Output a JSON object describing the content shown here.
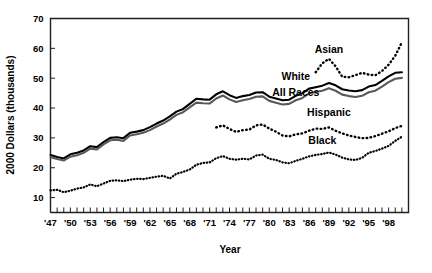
{
  "chart_data": {
    "type": "line",
    "title": "",
    "xlabel": "Year",
    "ylabel": "2000 Dollars (thousands)",
    "xlim": [
      1947,
      2001
    ],
    "ylim": [
      5,
      70
    ],
    "yticks": [
      10,
      20,
      30,
      40,
      50,
      60,
      70
    ],
    "ytick_labels": [
      "10",
      "20",
      "30",
      "40",
      "50",
      "60",
      "70"
    ],
    "xtick_labels": [
      "'47",
      "'50",
      "'53",
      "'56",
      "'59",
      "'62",
      "'65",
      "'68",
      "'71",
      "'74",
      "'77",
      "'80",
      "'83",
      "'86",
      "'89",
      "'92",
      "'95",
      "'98"
    ],
    "xtick_label_years": [
      1947,
      1950,
      1953,
      1956,
      1959,
      1962,
      1965,
      1968,
      1971,
      1974,
      1977,
      1980,
      1983,
      1986,
      1989,
      1992,
      1995,
      1998
    ],
    "minor_tick_years": [
      1947,
      1948,
      1949,
      1950,
      1951,
      1952,
      1953,
      1954,
      1955,
      1956,
      1957,
      1958,
      1959,
      1960,
      1961,
      1962,
      1963,
      1964,
      1965,
      1966,
      1967,
      1968,
      1969,
      1970,
      1971,
      1972,
      1973,
      1974,
      1975,
      1976,
      1977,
      1978,
      1979,
      1980,
      1981,
      1982,
      1983,
      1984,
      1985,
      1986,
      1987,
      1988,
      1989,
      1990,
      1991,
      1992,
      1993,
      1994,
      1995,
      1996,
      1997,
      1998,
      1999,
      2000,
      2001
    ],
    "grid": false,
    "legend_position": "inline-annotations",
    "series": [
      {
        "name": "White",
        "style": "solid",
        "color": "#000000",
        "width": 2.1,
        "label_x": 1984,
        "label_y": 49.5,
        "x": [
          1947,
          1948,
          1949,
          1950,
          1951,
          1952,
          1953,
          1954,
          1955,
          1956,
          1957,
          1958,
          1959,
          1960,
          1961,
          1962,
          1963,
          1964,
          1965,
          1966,
          1967,
          1968,
          1969,
          1970,
          1971,
          1972,
          1973,
          1974,
          1975,
          1976,
          1977,
          1978,
          1979,
          1980,
          1981,
          1982,
          1983,
          1984,
          1985,
          1986,
          1987,
          1988,
          1989,
          1990,
          1991,
          1992,
          1993,
          1994,
          1995,
          1996,
          1997,
          1998,
          1999,
          2000
        ],
        "values": [
          24.3,
          23.6,
          23.1,
          24.5,
          25.0,
          25.8,
          27.2,
          26.9,
          28.6,
          30.0,
          30.2,
          29.9,
          31.7,
          32.1,
          32.6,
          33.6,
          34.8,
          35.8,
          37.2,
          38.8,
          39.7,
          41.4,
          43.1,
          42.9,
          42.8,
          44.6,
          45.6,
          44.3,
          43.4,
          44.0,
          44.4,
          45.2,
          45.3,
          43.8,
          43.2,
          42.6,
          42.8,
          44.1,
          45.0,
          46.5,
          47.0,
          47.5,
          48.4,
          47.6,
          46.3,
          45.9,
          45.6,
          46.0,
          47.2,
          47.7,
          49.1,
          50.6,
          51.8,
          52.0
        ]
      },
      {
        "name": "All Races",
        "style": "solid",
        "color": "#58595b",
        "width": 2.1,
        "label_x": 1984,
        "label_y": 44.0,
        "x": [
          1947,
          1948,
          1949,
          1950,
          1951,
          1952,
          1953,
          1954,
          1955,
          1956,
          1957,
          1958,
          1959,
          1960,
          1961,
          1962,
          1963,
          1964,
          1965,
          1966,
          1967,
          1968,
          1969,
          1970,
          1971,
          1972,
          1973,
          1974,
          1975,
          1976,
          1977,
          1978,
          1979,
          1980,
          1981,
          1982,
          1983,
          1984,
          1985,
          1986,
          1987,
          1988,
          1989,
          1990,
          1991,
          1992,
          1993,
          1994,
          1995,
          1996,
          1997,
          1998,
          1999,
          2000
        ],
        "values": [
          23.5,
          22.9,
          22.4,
          23.7,
          24.2,
          25.0,
          26.4,
          26.1,
          27.8,
          29.2,
          29.4,
          29.0,
          30.8,
          31.2,
          31.7,
          32.6,
          33.8,
          34.8,
          36.1,
          37.7,
          38.6,
          40.2,
          41.8,
          41.6,
          41.5,
          43.2,
          44.2,
          42.9,
          42.0,
          42.6,
          43.0,
          43.8,
          43.9,
          42.4,
          41.8,
          41.2,
          41.4,
          42.6,
          43.4,
          44.9,
          45.4,
          45.8,
          46.6,
          45.8,
          44.5,
          44.0,
          43.7,
          44.1,
          45.3,
          45.8,
          47.2,
          48.7,
          49.8,
          50.1
        ]
      },
      {
        "name": "Asian",
        "style": "dotted",
        "color": "#000000",
        "width": 2.4,
        "dash": "0.6,3.4",
        "label_x": 1989,
        "label_y": 58.5,
        "x": [
          1987,
          1988,
          1989,
          1990,
          1991,
          1992,
          1993,
          1994,
          1995,
          1996,
          1997,
          1998,
          1999,
          2000
        ],
        "values": [
          52.0,
          55.0,
          56.5,
          54.0,
          50.5,
          50.3,
          51.0,
          51.8,
          51.2,
          51.0,
          52.4,
          54.5,
          57.5,
          62.0
        ]
      },
      {
        "name": "Hispanic",
        "style": "dotted",
        "color": "#000000",
        "width": 2.4,
        "dash": "0.6,3.4",
        "label_x": 1989,
        "label_y": 37.5,
        "x": [
          1972,
          1973,
          1974,
          1975,
          1976,
          1977,
          1978,
          1979,
          1980,
          1981,
          1982,
          1983,
          1984,
          1985,
          1986,
          1987,
          1988,
          1989,
          1990,
          1991,
          1992,
          1993,
          1994,
          1995,
          1996,
          1997,
          1998,
          1999,
          2000
        ],
        "values": [
          33.5,
          34.2,
          33.0,
          32.0,
          32.6,
          32.8,
          34.2,
          34.5,
          33.1,
          32.1,
          30.8,
          30.5,
          31.2,
          31.5,
          32.4,
          33.1,
          33.0,
          33.5,
          32.4,
          31.5,
          30.8,
          30.3,
          29.9,
          30.0,
          30.6,
          31.4,
          32.2,
          33.3,
          34.0
        ]
      },
      {
        "name": "Black",
        "style": "dotted",
        "color": "#000000",
        "width": 2.2,
        "dash": "0.5,2.6",
        "label_x": 1988,
        "label_y": 28.0,
        "x": [
          1947,
          1948,
          1949,
          1950,
          1951,
          1952,
          1953,
          1954,
          1955,
          1956,
          1957,
          1958,
          1959,
          1960,
          1961,
          1962,
          1963,
          1964,
          1965,
          1966,
          1967,
          1968,
          1969,
          1970,
          1971,
          1972,
          1973,
          1974,
          1975,
          1976,
          1977,
          1978,
          1979,
          1980,
          1981,
          1982,
          1983,
          1984,
          1985,
          1986,
          1987,
          1988,
          1989,
          1990,
          1991,
          1992,
          1993,
          1994,
          1995,
          1996,
          1997,
          1998,
          1999,
          2000
        ],
        "values": [
          12.4,
          12.6,
          11.8,
          12.3,
          13.0,
          13.4,
          14.4,
          13.8,
          14.7,
          15.6,
          15.8,
          15.5,
          16.0,
          16.3,
          16.2,
          16.6,
          17.0,
          17.3,
          16.4,
          18.0,
          18.6,
          19.4,
          21.0,
          21.6,
          21.8,
          23.2,
          23.9,
          23.0,
          22.7,
          23.0,
          22.8,
          24.1,
          24.4,
          23.0,
          22.6,
          21.8,
          21.5,
          22.3,
          23.0,
          23.8,
          24.3,
          24.6,
          25.1,
          24.4,
          23.4,
          22.8,
          22.6,
          23.3,
          25.0,
          25.6,
          26.4,
          27.3,
          29.0,
          30.4
        ]
      }
    ]
  },
  "axis": {
    "y_title": "2000 Dollars (thousands)",
    "x_title": "Year"
  }
}
